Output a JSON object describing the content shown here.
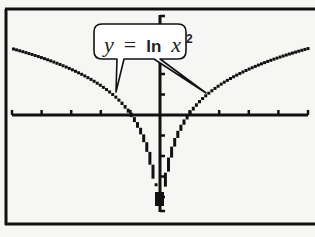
{
  "screen": {
    "background": "#f6f6f4",
    "pixel_color": "#111111",
    "frame_color": "#111111"
  },
  "label": {
    "y_var": "y",
    "equals": "=",
    "fn": "ln",
    "x_var": "x",
    "exponent": "2",
    "full_text": "y = ln x²"
  },
  "chart_data": {
    "type": "line",
    "title": "",
    "annotation": "y = ln x²",
    "xlabel": "",
    "ylabel": "",
    "xlim": [
      -5,
      5
    ],
    "ylim": [
      -5,
      3
    ],
    "x_tick_step": 1,
    "y_tick_step": 1,
    "grid": false,
    "legend": null,
    "series": [
      {
        "name": "y = ln x^2",
        "x": [
          -5,
          -4,
          -3,
          -2,
          -1.5,
          -1,
          -0.75,
          -0.5,
          -0.3,
          -0.2,
          0.2,
          0.3,
          0.5,
          0.75,
          1,
          1.5,
          2,
          3,
          4,
          5
        ],
        "y": [
          3.22,
          2.77,
          2.2,
          1.39,
          0.81,
          0,
          -0.58,
          -1.39,
          -2.41,
          -3.22,
          -3.22,
          -2.41,
          -1.39,
          -0.58,
          0,
          0.81,
          1.39,
          2.2,
          2.77,
          3.22
        ]
      }
    ],
    "x_intercepts": [
      -1,
      1
    ],
    "vertical_asymptote": 0
  }
}
